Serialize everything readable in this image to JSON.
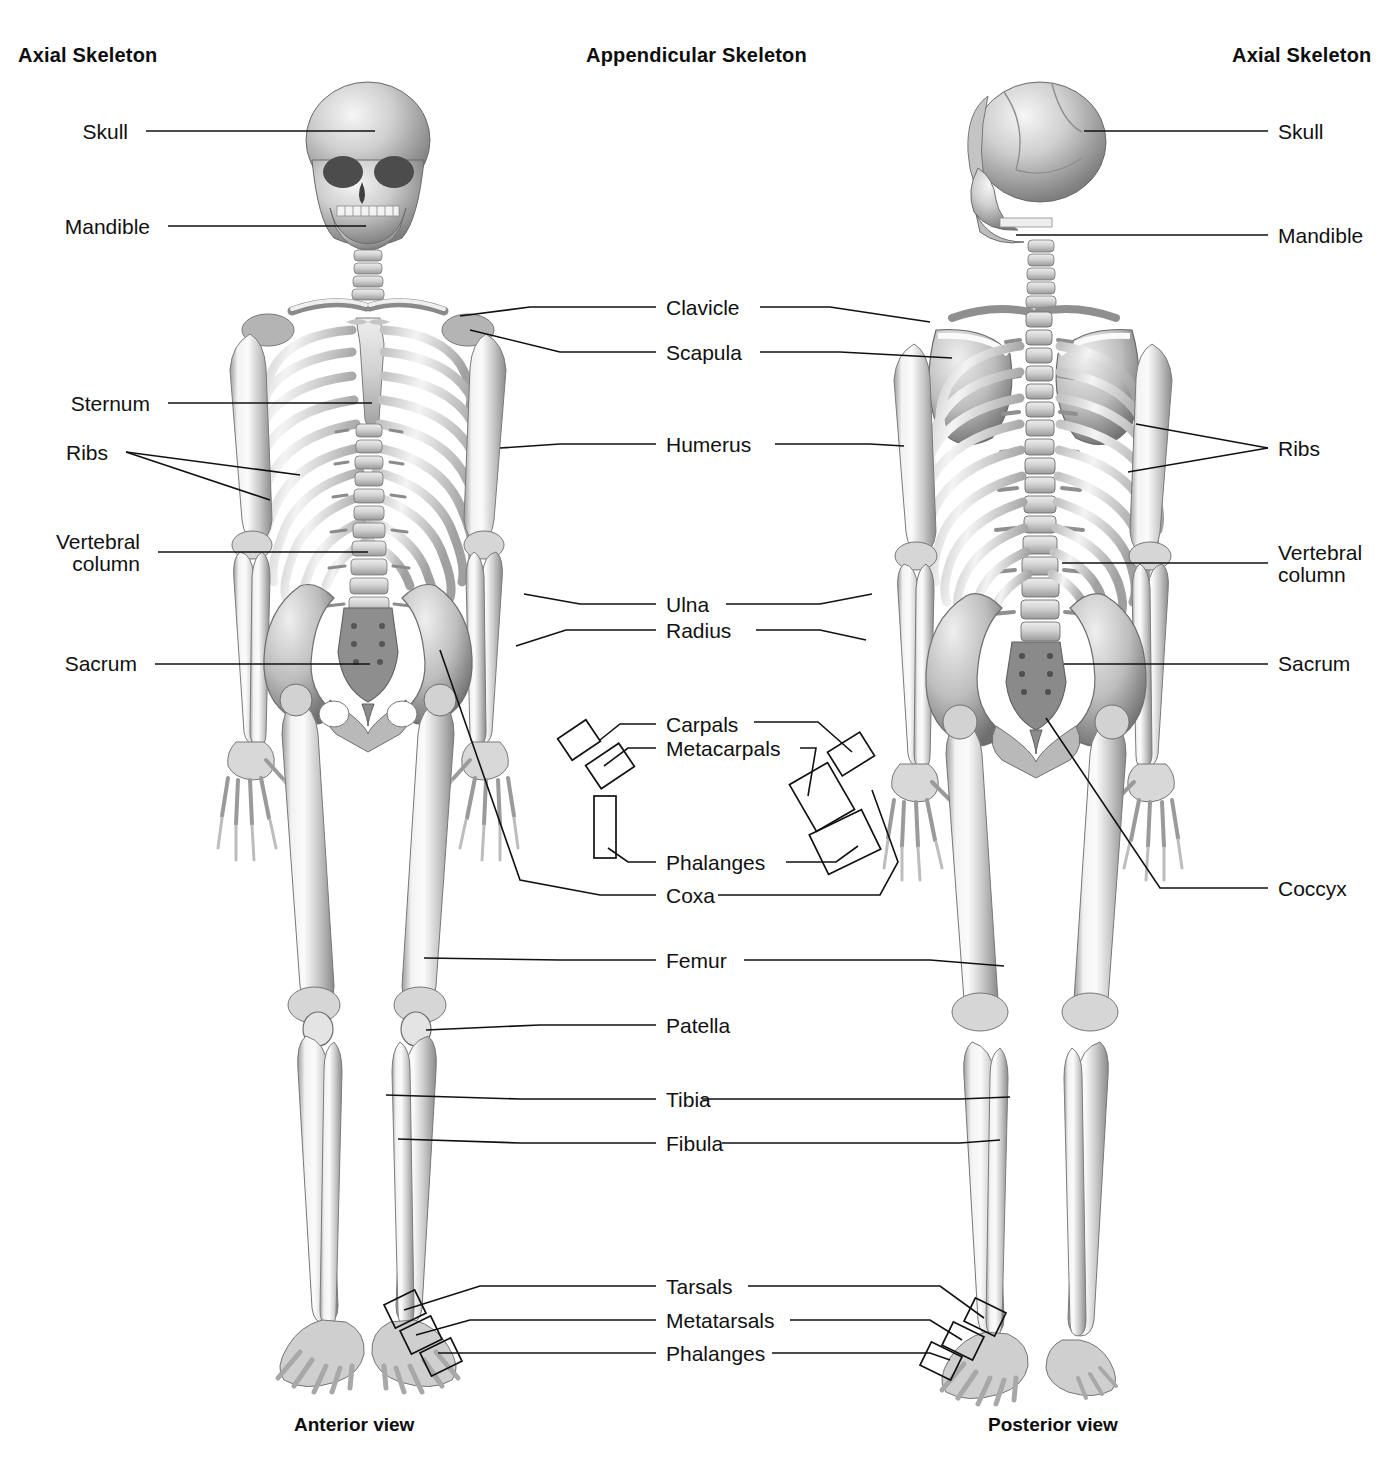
{
  "page": {
    "background": "#ffffff",
    "ink": "#111111"
  },
  "headings": {
    "left": "Axial Skeleton",
    "center": "Appendicular Skeleton",
    "right": "Axial Skeleton"
  },
  "captions": {
    "left": "Anterior view",
    "right": "Posterior view"
  },
  "left_labels": [
    {
      "text": "Skull",
      "y": 130
    },
    {
      "text": "Mandible",
      "y": 225
    },
    {
      "text": "Sternum",
      "y": 403
    },
    {
      "text": "Ribs",
      "y": 452
    },
    {
      "text": "Vertebral",
      "y": 541
    },
    {
      "text": "column",
      "y": 563
    },
    {
      "text": "Sacrum",
      "y": 663
    }
  ],
  "center_labels": [
    {
      "text": "Clavicle",
      "y": 307
    },
    {
      "text": "Scapula",
      "y": 352
    },
    {
      "text": "Humerus",
      "y": 444
    },
    {
      "text": "Ulna",
      "y": 604
    },
    {
      "text": "Radius",
      "y": 630
    },
    {
      "text": "Carpals",
      "y": 724
    },
    {
      "text": "Metacarpals",
      "y": 748
    },
    {
      "text": "Phalanges",
      "y": 862
    },
    {
      "text": "Coxa",
      "y": 895
    },
    {
      "text": "Femur",
      "y": 960
    },
    {
      "text": "Patella",
      "y": 1025
    },
    {
      "text": "Tibia",
      "y": 1099
    },
    {
      "text": "Fibula",
      "y": 1143
    },
    {
      "text": "Tarsals",
      "y": 1286
    },
    {
      "text": "Metatarsals",
      "y": 1320
    },
    {
      "text": "Phalanges",
      "y": 1353
    }
  ],
  "right_labels": [
    {
      "text": "Skull",
      "y": 130
    },
    {
      "text": "Mandible",
      "y": 234
    },
    {
      "text": "Ribs",
      "y": 448
    },
    {
      "text": "Vertebral",
      "y": 552
    },
    {
      "text": "column",
      "y": 574
    },
    {
      "text": "Sacrum",
      "y": 663
    },
    {
      "text": "Coccyx",
      "y": 888
    }
  ],
  "figures": [
    {
      "name": "anterior-skeleton",
      "view": "Anterior view"
    },
    {
      "name": "posterior-skeleton",
      "view": "Posterior view"
    }
  ]
}
